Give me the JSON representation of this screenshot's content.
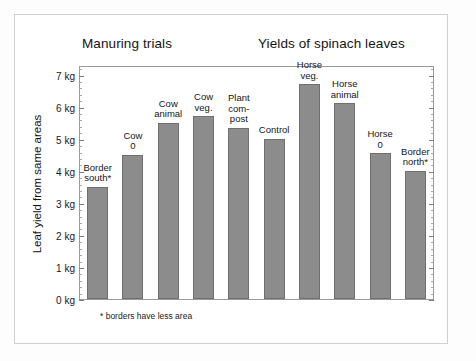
{
  "titles": {
    "left": "Manuring trials",
    "right": "Yields of spinach leaves"
  },
  "axis": {
    "y_title": "Leaf yield from same areas",
    "y_ticks": [
      "0 kg",
      "1 kg",
      "2 kg",
      "3 kg",
      "4 kg",
      "5 kg",
      "6 kg",
      "7 kg"
    ]
  },
  "footnote": "* borders have less area",
  "colors": {
    "bar_fill": "#8c8c8c",
    "bar_stroke": "#6f6f6f",
    "axis": "#9a9a9a",
    "frame": "#cfcfcf",
    "text": "#141414"
  },
  "chart_data": {
    "type": "bar",
    "title": "Yields of spinach leaves",
    "subtitle": "Manuring trials",
    "xlabel": "",
    "ylabel": "Leaf yield from same areas",
    "ylim": [
      0,
      7.3
    ],
    "yunit": "kg",
    "ytick_values": [
      0,
      1,
      2,
      3,
      4,
      5,
      6,
      7
    ],
    "ytick_labels": [
      "0 kg",
      "1 kg",
      "2 kg",
      "3 kg",
      "4 kg",
      "5 kg",
      "6 kg",
      "7 kg"
    ],
    "grid": false,
    "legend": false,
    "note": "* borders have less area",
    "categories": [
      "Border south*",
      "Cow 0",
      "Cow animal",
      "Cow veg.",
      "Plant com-post",
      "Control",
      "Horse veg.",
      "Horse animal",
      "Horse 0",
      "Border north*"
    ],
    "values": [
      3.5,
      4.5,
      5.5,
      5.7,
      5.35,
      5.0,
      6.7,
      6.1,
      4.55,
      4.0
    ],
    "bars": [
      {
        "label": "Border\nsouth*",
        "value": 3.5
      },
      {
        "label": "Cow\n0",
        "value": 4.5
      },
      {
        "label": "Cow\nanimal",
        "value": 5.5
      },
      {
        "label": "Cow\nveg.",
        "value": 5.7
      },
      {
        "label": "Plant\ncom-\npost",
        "value": 5.35
      },
      {
        "label": "Control",
        "value": 5.0
      },
      {
        "label": "Horse\nveg.",
        "value": 6.7
      },
      {
        "label": "Horse\nanimal",
        "value": 6.1
      },
      {
        "label": "Horse\n0",
        "value": 4.55
      },
      {
        "label": "Border\nnorth*",
        "value": 4.0
      }
    ]
  }
}
